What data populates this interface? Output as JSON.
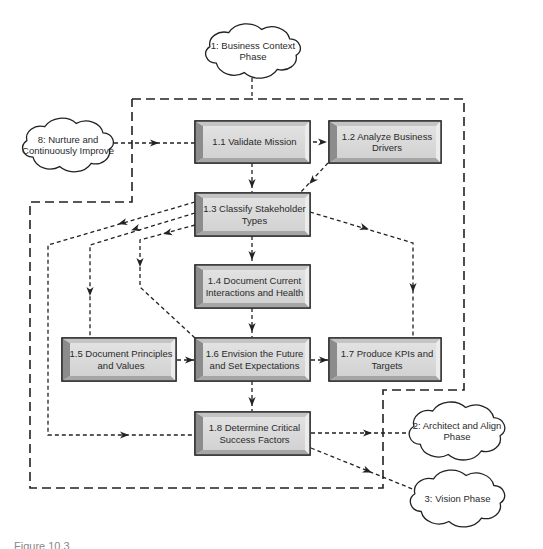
{
  "diagram": {
    "colors": {
      "box_fill": "#d9d9d9",
      "box_bevel_dark": "#8c8c8c",
      "box_bevel_light": "#ececec",
      "box_border": "#2e2e2e",
      "line": "#222222",
      "background": "#ffffff"
    },
    "boundary": {
      "points": "132,99 464,99 464,390 383,390 383,488 30,488 30,202 132,202 132,99"
    },
    "clouds": [
      {
        "id": "c1",
        "lines": [
          "1: Business Context",
          "Phase"
        ],
        "x": 205,
        "y": 24,
        "w": 96,
        "h": 54
      },
      {
        "id": "c8",
        "lines": [
          "8: Nurture and",
          "Continuously Improve"
        ],
        "x": 22,
        "y": 118,
        "w": 92,
        "h": 54
      },
      {
        "id": "c2",
        "lines": [
          "2: Architect and Align",
          "Phase"
        ],
        "x": 409,
        "y": 402,
        "w": 96,
        "h": 58
      },
      {
        "id": "c3",
        "lines": [
          "3: Vision Phase"
        ],
        "x": 410,
        "y": 470,
        "w": 95,
        "h": 57
      }
    ],
    "boxes": [
      {
        "id": "b11",
        "lines": [
          "1.1 Validate Mission"
        ],
        "x": 195,
        "y": 121,
        "w": 115,
        "h": 42
      },
      {
        "id": "b12",
        "lines": [
          "1.2 Analyze Business",
          "Drivers"
        ],
        "x": 329,
        "y": 121,
        "w": 112,
        "h": 42
      },
      {
        "id": "b13",
        "lines": [
          "1.3 Classify Stakeholder",
          "Types"
        ],
        "x": 195,
        "y": 193,
        "w": 115,
        "h": 43
      },
      {
        "id": "b14",
        "lines": [
          "1.4 Document Current",
          "Interactions and Health"
        ],
        "x": 195,
        "y": 265,
        "w": 115,
        "h": 43
      },
      {
        "id": "b15",
        "lines": [
          "1.5 Document Principles",
          "and Values"
        ],
        "x": 62,
        "y": 338,
        "w": 114,
        "h": 43
      },
      {
        "id": "b16",
        "lines": [
          "1.6 Envision the Future",
          "and Set Expectations"
        ],
        "x": 195,
        "y": 338,
        "w": 115,
        "h": 43
      },
      {
        "id": "b17",
        "lines": [
          "1.7 Produce KPIs and",
          "Targets"
        ],
        "x": 329,
        "y": 338,
        "w": 112,
        "h": 43
      },
      {
        "id": "b18",
        "lines": [
          "1.8 Determine Critical",
          "Success Factors"
        ],
        "x": 195,
        "y": 412,
        "w": 115,
        "h": 43
      }
    ],
    "connectors": [
      {
        "from": "c1",
        "to": "boundary",
        "points": "252,78 252,99",
        "arrow": false
      },
      {
        "from": "c8",
        "to": "b11",
        "points": "114,143 195,143",
        "arrow_at": [
          155,
          143
        ],
        "dir": 0
      },
      {
        "from": "b11",
        "to": "b12",
        "points": "313,142 327,142",
        "arrow_at": [
          323,
          142
        ],
        "dir": 0
      },
      {
        "from": "b11",
        "to": "b13",
        "points": "252,163 252,192",
        "arrow_at": [
          252,
          184
        ],
        "dir": 90
      },
      {
        "from": "b12",
        "to": "b13",
        "points": "328,163 300,193",
        "arrow_at": [
          312,
          181
        ],
        "dir": 133
      },
      {
        "from": "b13",
        "to": "b18",
        "points": "195,202 48,245 48,435 195,435",
        "arrow_at": [
          122,
          223
        ],
        "dir": 164,
        "arrow2_at": [
          125,
          435
        ],
        "dir2": 0
      },
      {
        "from": "b13",
        "to": "b15",
        "points": "195,213 90,245 90,338",
        "arrow_at": [
          135,
          229
        ],
        "dir": 163,
        "arrow2_at": [
          90,
          292
        ],
        "dir2": 90
      },
      {
        "from": "b13",
        "to": "b16",
        "points": "195,225 140,240 140,287 195,338",
        "arrow_at": [
          167,
          233
        ],
        "dir": 165,
        "arrow2_at": [
          140,
          263
        ],
        "dir2": 90
      },
      {
        "from": "b13",
        "to": "b14",
        "points": "252,236 252,264",
        "arrow_at": [
          252,
          256
        ],
        "dir": 90
      },
      {
        "from": "b13",
        "to": "b17",
        "points": "310,212 413,243 413,338",
        "arrow_at": [
          365,
          228
        ],
        "dir": 17,
        "arrow2_at": [
          413,
          288
        ],
        "dir2": 90
      },
      {
        "from": "b14",
        "to": "b16",
        "points": "252,308 252,337",
        "arrow_at": [
          252,
          328
        ],
        "dir": 90
      },
      {
        "from": "b15",
        "to": "b16",
        "points": "177,360 194,360",
        "arrow_at": [
          190,
          360
        ],
        "dir": 0
      },
      {
        "from": "b16",
        "to": "b17",
        "points": "311,360 328,360",
        "arrow_at": [
          324,
          360
        ],
        "dir": 0
      },
      {
        "from": "b16",
        "to": "b18",
        "points": "252,381 252,411",
        "arrow_at": [
          252,
          402
        ],
        "dir": 90
      },
      {
        "from": "b18",
        "to": "c2",
        "points": "311,433 410,433",
        "arrow_at": [
          368,
          433
        ],
        "dir": 0
      },
      {
        "from": "b18",
        "to": "c3",
        "points": "311,448 415,490",
        "arrow_at": [
          368,
          471
        ],
        "dir": 22
      }
    ]
  },
  "caption": {
    "text": "Figure 10.3"
  }
}
